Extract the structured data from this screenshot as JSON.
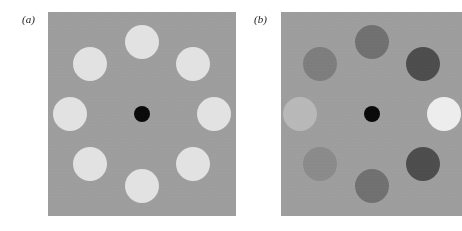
{
  "figure": {
    "width": 462,
    "height": 231,
    "background_color": "#ffffff",
    "caption_style": "italic-parenthetical"
  },
  "panels": [
    {
      "id": "panel-a",
      "label": "(a)",
      "label_x": 22,
      "label_y": 14,
      "x": 48,
      "y": 12,
      "width": 188,
      "height": 204,
      "background_color": "#9d9d9d",
      "center_disc": {
        "name": "fixation-dot",
        "cx": 94,
        "cy": 102,
        "r": 8,
        "color": "#0a0a0a"
      },
      "ring_radius_x": 70,
      "ring_radius_y": 72,
      "disc_radius": 17,
      "discs": [
        {
          "name": "disc-top",
          "angle": 270,
          "cx": 94,
          "cy": 30,
          "r": 17,
          "color": "#e2e2e2"
        },
        {
          "name": "disc-top-right",
          "angle": 315,
          "cx": 145,
          "cy": 52,
          "r": 17,
          "color": "#e2e2e2"
        },
        {
          "name": "disc-right",
          "angle": 0,
          "cx": 166,
          "cy": 102,
          "r": 17,
          "color": "#e2e2e2"
        },
        {
          "name": "disc-bottom-right",
          "angle": 45,
          "cx": 145,
          "cy": 152,
          "r": 17,
          "color": "#e2e2e2"
        },
        {
          "name": "disc-bottom",
          "angle": 90,
          "cx": 94,
          "cy": 174,
          "r": 17,
          "color": "#e2e2e2"
        },
        {
          "name": "disc-bottom-left",
          "angle": 135,
          "cx": 42,
          "cy": 152,
          "r": 17,
          "color": "#e2e2e2"
        },
        {
          "name": "disc-left",
          "angle": 180,
          "cx": 22,
          "cy": 102,
          "r": 17,
          "color": "#e2e2e2"
        },
        {
          "name": "disc-top-left",
          "angle": 225,
          "cx": 42,
          "cy": 52,
          "r": 17,
          "color": "#e2e2e2"
        }
      ]
    },
    {
      "id": "panel-b",
      "label": "(b)",
      "label_x": 254,
      "label_y": 14,
      "x": 281,
      "y": 12,
      "width": 181,
      "height": 204,
      "background_color": "#9d9d9d",
      "center_disc": {
        "name": "fixation-dot",
        "cx": 91,
        "cy": 102,
        "r": 8,
        "color": "#0a0a0a"
      },
      "ring_radius_x": 70,
      "ring_radius_y": 72,
      "disc_radius": 17,
      "discs": [
        {
          "name": "disc-top",
          "angle": 270,
          "cx": 91,
          "cy": 30,
          "r": 17,
          "color": "#707070"
        },
        {
          "name": "disc-top-right",
          "angle": 315,
          "cx": 142,
          "cy": 52,
          "r": 17,
          "color": "#4d4d4d"
        },
        {
          "name": "disc-right",
          "angle": 0,
          "cx": 163,
          "cy": 102,
          "r": 17,
          "color": "#ededed"
        },
        {
          "name": "disc-bottom-right",
          "angle": 45,
          "cx": 142,
          "cy": 152,
          "r": 17,
          "color": "#4d4d4d"
        },
        {
          "name": "disc-bottom",
          "angle": 90,
          "cx": 91,
          "cy": 174,
          "r": 17,
          "color": "#707070"
        },
        {
          "name": "disc-bottom-left",
          "angle": 135,
          "cx": 39,
          "cy": 152,
          "r": 17,
          "color": "#8a8a8a"
        },
        {
          "name": "disc-left",
          "angle": 180,
          "cx": 19,
          "cy": 102,
          "r": 17,
          "color": "#b8b8b8"
        },
        {
          "name": "disc-top-left",
          "angle": 225,
          "cx": 39,
          "cy": 52,
          "r": 17,
          "color": "#7d7d7d"
        }
      ]
    }
  ]
}
